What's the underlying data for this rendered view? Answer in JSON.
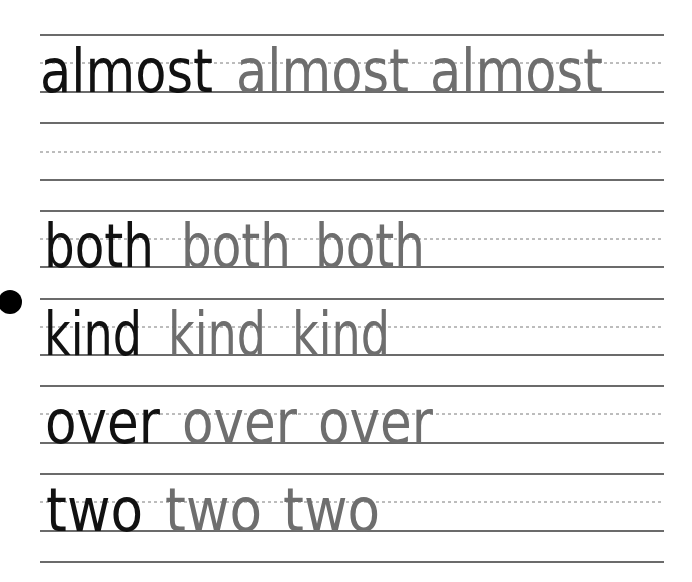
{
  "worksheet": {
    "colors": {
      "model_word": "#111111",
      "trace_word": "#6e6e6e",
      "rule_line": "#3a3a3a",
      "midline": "#7a7a7a"
    },
    "rows": [
      {
        "word": "almost",
        "top": 35,
        "mid": 63,
        "base": 92,
        "x": [
          40,
          236,
          430
        ],
        "w": 173
      },
      {
        "word": "",
        "top": 123,
        "mid": 152,
        "base": 180,
        "x": [],
        "w": 0
      },
      {
        "word": "both",
        "top": 211,
        "mid": 239,
        "base": 267,
        "x": [
          44,
          181,
          315
        ],
        "w": 110
      },
      {
        "word": "kind",
        "top": 299,
        "mid": 327,
        "base": 355,
        "x": [
          44,
          168,
          292
        ],
        "w": 98
      },
      {
        "word": "over",
        "top": 386,
        "mid": 414,
        "base": 443,
        "x": [
          45,
          182,
          318
        ],
        "w": 115
      },
      {
        "word": "two",
        "top": 474,
        "mid": 502,
        "base": 531,
        "x": [
          46,
          165,
          283
        ],
        "w": 97
      }
    ],
    "final_line": 562,
    "bullet": {
      "cx": 10,
      "cy": 302,
      "r": 12
    },
    "words": {
      "almost": [
        "almost",
        "almost",
        "almost"
      ],
      "both": [
        "both",
        "both",
        "both"
      ],
      "kind": [
        "kind",
        "kind",
        "kind"
      ],
      "over": [
        "over",
        "over",
        "over"
      ],
      "two": [
        "two",
        "two",
        "two"
      ]
    }
  }
}
